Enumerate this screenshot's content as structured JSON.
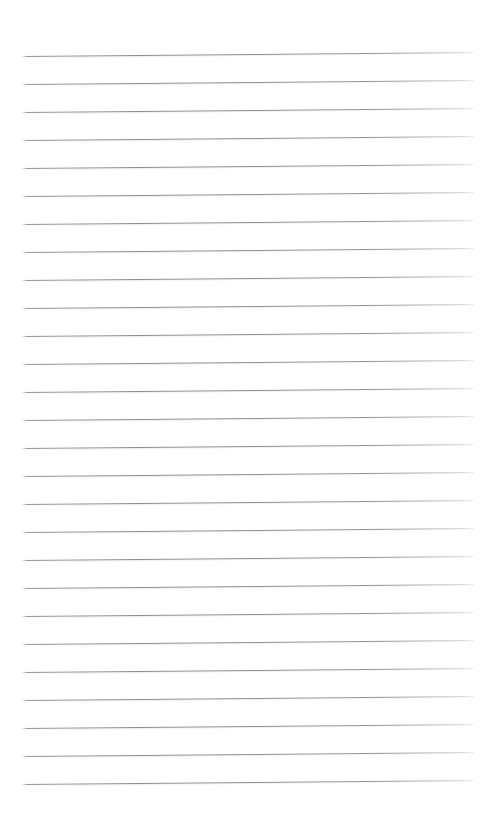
{
  "document": {
    "kind": "ruled-notebook-paper",
    "title": "Blank ruled paper",
    "background_color": "#ffffff",
    "page_width": 496,
    "page_height": 816,
    "content_text": ""
  },
  "ruling": {
    "line_color": "#8e8e91",
    "line_thickness_px": 1,
    "line_count": 27,
    "line_spacing_px": 28,
    "first_line_y": 56,
    "last_line_y": 784,
    "line_start_x": 22,
    "line_end_x": 475,
    "line_length_px": 453,
    "tilt_degrees": -0.5,
    "left_margin_px": 22,
    "right_margin_px": 21,
    "top_margin_px": 56,
    "bottom_margin_px": 32,
    "lines": [
      {
        "index": 1,
        "y": 56,
        "x_start": 22,
        "x_end": 475
      },
      {
        "index": 2,
        "y": 84,
        "x_start": 22,
        "x_end": 475
      },
      {
        "index": 3,
        "y": 112,
        "x_start": 22,
        "x_end": 475
      },
      {
        "index": 4,
        "y": 140,
        "x_start": 22,
        "x_end": 475
      },
      {
        "index": 5,
        "y": 168,
        "x_start": 22,
        "x_end": 475
      },
      {
        "index": 6,
        "y": 196,
        "x_start": 22,
        "x_end": 475
      },
      {
        "index": 7,
        "y": 224,
        "x_start": 22,
        "x_end": 475
      },
      {
        "index": 8,
        "y": 252,
        "x_start": 22,
        "x_end": 475
      },
      {
        "index": 9,
        "y": 280,
        "x_start": 22,
        "x_end": 475
      },
      {
        "index": 10,
        "y": 308,
        "x_start": 22,
        "x_end": 475
      },
      {
        "index": 11,
        "y": 336,
        "x_start": 22,
        "x_end": 475
      },
      {
        "index": 12,
        "y": 364,
        "x_start": 22,
        "x_end": 475
      },
      {
        "index": 13,
        "y": 392,
        "x_start": 22,
        "x_end": 475
      },
      {
        "index": 14,
        "y": 420,
        "x_start": 22,
        "x_end": 475
      },
      {
        "index": 15,
        "y": 448,
        "x_start": 22,
        "x_end": 475
      },
      {
        "index": 16,
        "y": 476,
        "x_start": 22,
        "x_end": 475
      },
      {
        "index": 17,
        "y": 504,
        "x_start": 22,
        "x_end": 475
      },
      {
        "index": 18,
        "y": 532,
        "x_start": 22,
        "x_end": 475
      },
      {
        "index": 19,
        "y": 560,
        "x_start": 22,
        "x_end": 475
      },
      {
        "index": 20,
        "y": 588,
        "x_start": 22,
        "x_end": 475
      },
      {
        "index": 21,
        "y": 616,
        "x_start": 22,
        "x_end": 475
      },
      {
        "index": 22,
        "y": 644,
        "x_start": 22,
        "x_end": 475
      },
      {
        "index": 23,
        "y": 672,
        "x_start": 22,
        "x_end": 475
      },
      {
        "index": 24,
        "y": 700,
        "x_start": 22,
        "x_end": 475
      },
      {
        "index": 25,
        "y": 728,
        "x_start": 22,
        "x_end": 475
      },
      {
        "index": 26,
        "y": 756,
        "x_start": 22,
        "x_end": 475
      },
      {
        "index": 27,
        "y": 784,
        "x_start": 22,
        "x_end": 475
      }
    ]
  }
}
